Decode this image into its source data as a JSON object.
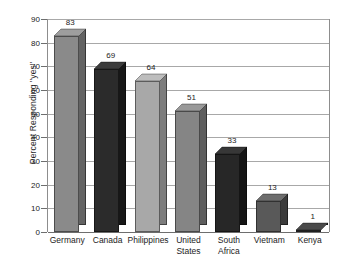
{
  "chart_data": {
    "type": "bar",
    "title": "",
    "subtitle": "",
    "xlabel": "",
    "ylabel": "Percent Responding \"yes\"",
    "ylim": [
      0,
      90
    ],
    "ytick_step": 10,
    "yticks": [
      0,
      10,
      20,
      30,
      40,
      50,
      60,
      70,
      80,
      90
    ],
    "grid": true,
    "legend": false,
    "legend_position": "none",
    "style": "3d-bars-grayscale",
    "categories": [
      "Germany",
      "Canada",
      "Philippines",
      "United States",
      "South Africa",
      "Vietnam",
      "Kenya"
    ],
    "values": [
      83,
      69,
      64,
      51,
      33,
      13,
      1
    ],
    "data_labels": [
      "83",
      "69",
      "64",
      "51",
      "33",
      "13",
      "1"
    ],
    "bar_colors": [
      "#8a8a8a",
      "#2b2b2b",
      "#a8a8a8",
      "#858585",
      "#272727",
      "#595959",
      "#3a3a3a"
    ],
    "bar_side_colors": [
      "#636363",
      "#171717",
      "#7d7d7d",
      "#5e5e5e",
      "#141414",
      "#3c3c3c",
      "#222222"
    ],
    "bar_top_colors": [
      "#9e9e9e",
      "#3c3c3c",
      "#bdbdbd",
      "#999999",
      "#373737",
      "#6d6d6d",
      "#4a4a4a"
    ],
    "axis_color": "#8d8d8d",
    "gridline_color": "#a8a8a8",
    "background_color": "#ffffff"
  },
  "x_labels": [
    {
      "line1": "Germany",
      "line2": ""
    },
    {
      "line1": "Canada",
      "line2": ""
    },
    {
      "line1": "Philippines",
      "line2": ""
    },
    {
      "line1": "United",
      "line2": "States"
    },
    {
      "line1": "South",
      "line2": "Africa"
    },
    {
      "line1": "Vietnam",
      "line2": ""
    },
    {
      "line1": "Kenya",
      "line2": ""
    }
  ]
}
